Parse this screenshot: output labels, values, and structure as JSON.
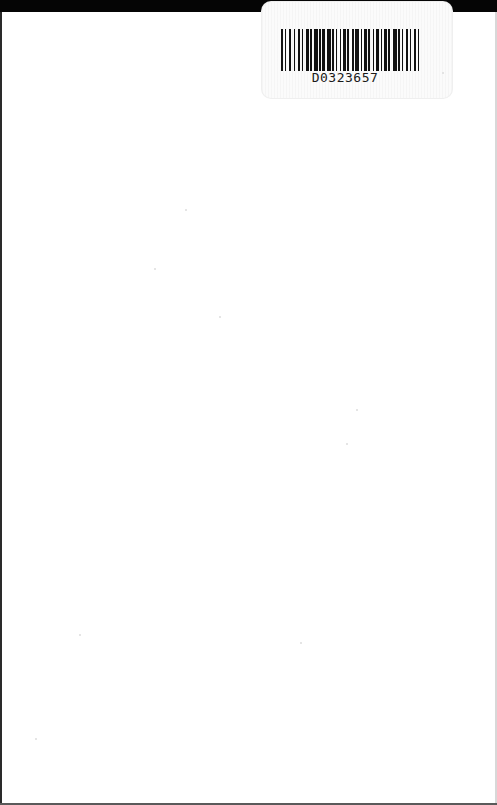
{
  "page": {
    "type": "scanned blank book endpaper",
    "background": "#ffffff",
    "edge_color": "#050505"
  },
  "barcode_sticker": {
    "code": "D0323657",
    "bar_color": "#111111",
    "pattern": [
      2,
      2,
      1,
      3,
      2,
      3,
      1,
      3,
      2,
      2,
      1,
      3,
      3,
      1,
      2,
      2,
      4,
      1,
      2,
      1,
      3,
      2,
      4,
      1,
      2,
      2,
      1,
      3,
      1,
      2,
      3,
      1,
      2,
      3,
      2,
      1,
      4,
      2,
      1,
      2,
      3,
      1,
      2,
      3,
      1,
      2,
      3,
      2,
      1,
      2,
      3,
      1,
      2,
      3,
      4,
      1,
      2,
      2,
      1,
      3,
      2,
      2,
      1,
      3,
      2,
      2,
      1,
      2
    ]
  }
}
